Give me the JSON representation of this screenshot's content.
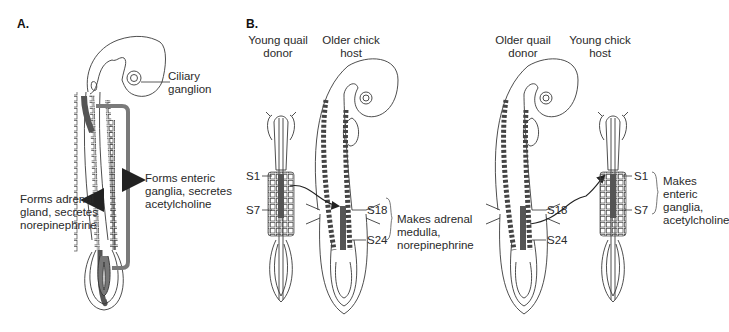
{
  "panels": {
    "a": {
      "label": "A.",
      "ciliary": [
        "Ciliary",
        "ganglion"
      ],
      "enteric": [
        "Forms enteric",
        "ganglia, secretes",
        "acetylcholine"
      ],
      "adrenal": [
        "Forms adrenal",
        "gland, secretes",
        "norepinephrine"
      ]
    },
    "b": {
      "label": "B.",
      "exp1": {
        "donor": [
          "Young quail",
          "donor"
        ],
        "host": [
          "Older chick",
          "host"
        ],
        "donor_somites": [
          "S1",
          "S7"
        ],
        "host_somites": [
          "S18",
          "S24"
        ],
        "result": [
          "Makes adrenal",
          "medulla,",
          "norepinephrine"
        ]
      },
      "exp2": {
        "donor": [
          "Older quail",
          "donor"
        ],
        "host": [
          "Young chick",
          "host"
        ],
        "donor_somites": [
          "S18",
          "S24"
        ],
        "host_somites": [
          "S1",
          "S7"
        ],
        "result": [
          "Makes",
          "enteric",
          "ganglia,",
          "acetylcholine"
        ]
      }
    }
  },
  "colors": {
    "outline": "#3a3a3a",
    "pathway": "#7a7a7a",
    "graft": "#555555"
  }
}
